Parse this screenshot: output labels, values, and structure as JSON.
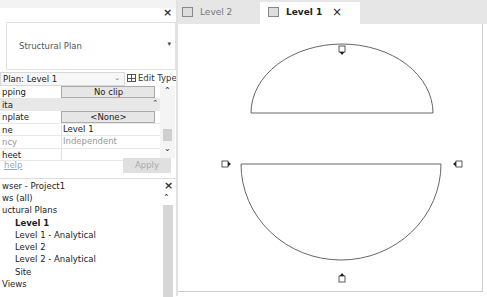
{
  "properties": {
    "close_icon": "×",
    "type_selector": {
      "label": "Structural Plan",
      "arrow": "▾"
    },
    "instance_selector": {
      "value": "Plan: Level 1",
      "arrow": "⌄"
    },
    "edit_type_label": "Edit Type",
    "rows": [
      {
        "key": "pping",
        "value": "No clip",
        "style": "button"
      },
      {
        "key": "ita",
        "value": "",
        "style": "section"
      },
      {
        "key": "nplate",
        "value": "<None>",
        "style": "button"
      },
      {
        "key": "ne",
        "value": "Level 1",
        "style": "plain"
      },
      {
        "key": "ncy",
        "value": "Independent",
        "style": "grey"
      },
      {
        "key": "heet",
        "value": "",
        "style": "plain"
      }
    ],
    "help_link": "help",
    "apply_label": "Apply"
  },
  "project_browser": {
    "title": "wser - Project1",
    "close_icon": "×",
    "tree": [
      {
        "label": "ws (all)",
        "level": 0,
        "bold": false
      },
      {
        "label": "uctural Plans",
        "level": 1,
        "bold": false
      },
      {
        "label": "Level 1",
        "level": 2,
        "bold": true
      },
      {
        "label": "Level 1 - Analytical",
        "level": 2,
        "bold": false
      },
      {
        "label": "Level 2",
        "level": 2,
        "bold": false
      },
      {
        "label": "Level 2 - Analytical",
        "level": 2,
        "bold": false
      },
      {
        "label": "Site",
        "level": 2,
        "bold": false
      },
      {
        "label": "Views",
        "level": 1,
        "bold": false
      }
    ]
  },
  "tabs": [
    {
      "label": "Level 2",
      "active": false
    },
    {
      "label": "Level 1",
      "active": true,
      "close_icon": "×"
    }
  ],
  "canvas": {
    "shapes": [
      {
        "type": "semicircle-up",
        "description": "upper half-disc outline with elevation marker on arc"
      },
      {
        "type": "semicircle-down",
        "description": "lower half-disc outline with elevation markers left, right and bottom"
      }
    ]
  }
}
